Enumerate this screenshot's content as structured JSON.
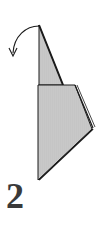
{
  "diagram": {
    "step_number": "2",
    "instruction_icon": "curved-fold-arrow-icon",
    "colors": {
      "paper_fill": "#c8c8c8",
      "outline": "#1a1a1a",
      "step_text": "#3a3a3a",
      "background": "#ffffff"
    }
  }
}
